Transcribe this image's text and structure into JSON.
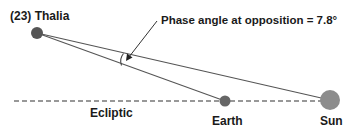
{
  "diagram": {
    "asteroid_label": "(23) Thalia",
    "annotation": "Phase angle at opposition = 7.8°",
    "ecliptic_label": "Ecliptic",
    "earth_label": "Earth",
    "sun_label": "Sun",
    "phase_angle_deg": 7.8,
    "colors": {
      "asteroid": "#555555",
      "earth": "#666666",
      "sun": "#8c8c8c",
      "lines": "#555555",
      "ecliptic": "#777777",
      "text": "#1a1a1a"
    }
  }
}
